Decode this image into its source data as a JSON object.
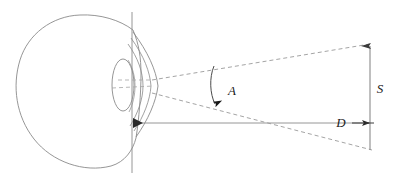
{
  "figure": {
    "type": "line-diagram",
    "background_color": "#ffffff",
    "line_color": "#6b6b6b",
    "solid_line_color": "#8a8a8a",
    "dashed_line_color": "#9a9a9a",
    "label_color": "#1a1a1a",
    "labels": [
      {
        "id": "angle",
        "text": "A",
        "meaning": "visual-angle",
        "x": 232,
        "y": 95
      },
      {
        "id": "size",
        "text": "S",
        "meaning": "stimulus-size",
        "x": 378,
        "y": 93
      },
      {
        "id": "distance",
        "text": "D",
        "meaning": "viewing-distance",
        "x": 340,
        "y": 124
      }
    ],
    "parts": {
      "eye_globe": "eyeball-outline",
      "iris": "iris-ellipse",
      "cornea": "cornea-bulge",
      "optical_axis": "horizontal-axis-line",
      "vertical_reference": "vertical-reference-line",
      "nodal_point": "nodal-point-arrowhead",
      "ray_upper": "upper-ray-dashed",
      "ray_lower": "lower-ray-dashed",
      "angle_arc": "angle-arc-with-arrowhead",
      "stimulus_bar": "stimulus-vertical-bar",
      "distance_arrow": "distance-arrow"
    }
  }
}
